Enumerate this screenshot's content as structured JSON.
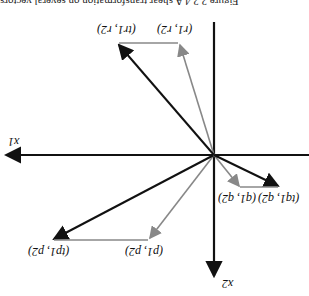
{
  "figure": {
    "orientation": "rotated 180 degrees",
    "caption": "Figure 2.2.4 A shear transformation on several vectors",
    "axes": {
      "x_label": "x1",
      "y_label": "x2"
    },
    "colors": {
      "original_vector": "#222222",
      "transformed_vector": "#888888",
      "axis": "#111111"
    },
    "points": {
      "r": "(r1, r2)",
      "tr": "(tr1, r2)",
      "p": "(p1, p2)",
      "tp": "(tp1, p2)",
      "q": "(q1, q2)",
      "tq": "(tq1, q2)"
    }
  }
}
